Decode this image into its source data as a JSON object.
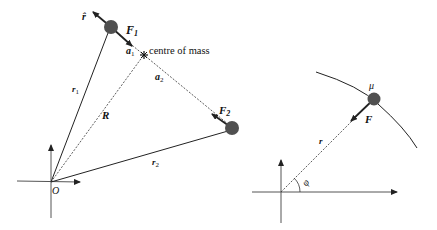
{
  "left_diagram": {
    "labels": {
      "r_hat": "r̂",
      "F1": "F",
      "F1_sub": "1",
      "a1": "a",
      "a1_sub": "1",
      "centre_of_mass": "centre of mass",
      "a2": "a",
      "a2_sub": "2",
      "r1": "r",
      "r1_sub": "1",
      "R": "R",
      "F2": "F",
      "F2_sub": "2",
      "r2": "r",
      "r2_sub": "2",
      "origin": "O"
    }
  },
  "right_diagram": {
    "labels": {
      "mu": "μ",
      "F": "F",
      "r": "r",
      "phi": "φ"
    }
  },
  "colors": {
    "mass_fill": "#505050",
    "line": "#222222",
    "axis": "#555555"
  }
}
